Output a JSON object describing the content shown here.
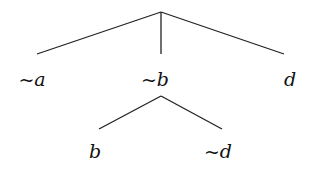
{
  "diagram": {
    "type": "tree",
    "line_color": "#222222",
    "nodes": [
      {
        "id": "root",
        "label": ""
      },
      {
        "id": "n1",
        "label": "~a"
      },
      {
        "id": "n2",
        "label": "~b"
      },
      {
        "id": "n3",
        "label": "d"
      },
      {
        "id": "n4",
        "label": "b"
      },
      {
        "id": "n5",
        "label": "~d"
      }
    ],
    "edges": [
      [
        "root",
        "n1"
      ],
      [
        "root",
        "n2"
      ],
      [
        "root",
        "n3"
      ],
      [
        "n2",
        "n4"
      ],
      [
        "n2",
        "n5"
      ]
    ]
  }
}
